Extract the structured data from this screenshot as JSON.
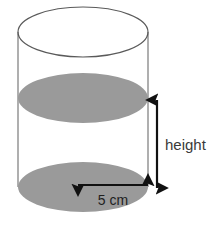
{
  "figure": {
    "background_color": "#ffffff"
  },
  "shape": {
    "name": "cylinder",
    "body_outline_color": "#8d8d8d",
    "top_face": {
      "name": "top-ellipse",
      "fill": "none",
      "stroke": "#5a5a5a",
      "cx": 83,
      "cy": 32,
      "rx": 65,
      "ry": 25
    },
    "middle_face": {
      "name": "middle-ellipse",
      "fill": "#9a9a9a",
      "stroke": "none",
      "cx": 83,
      "cy": 98,
      "rx": 65,
      "ry": 25
    },
    "bottom_face": {
      "name": "bottom-ellipse",
      "fill": "#9a9a9a",
      "stroke": "none",
      "cx": 83,
      "cy": 187,
      "rx": 65,
      "ry": 25
    },
    "left_wall_x": 18,
    "right_wall_x": 148
  },
  "annotations": {
    "height": {
      "label": "height",
      "arrow_color": "#111111",
      "orientation": "vertical",
      "x": 157,
      "y_top": 100,
      "y_bottom": 188,
      "label_x": 165,
      "label_y": 145
    },
    "diameter": {
      "label": "5 cm",
      "arrow_color": "#111111",
      "orientation": "horizontal",
      "y": 185,
      "x_left": 78,
      "x_right": 148,
      "label_x": 113,
      "label_y": 204
    }
  }
}
